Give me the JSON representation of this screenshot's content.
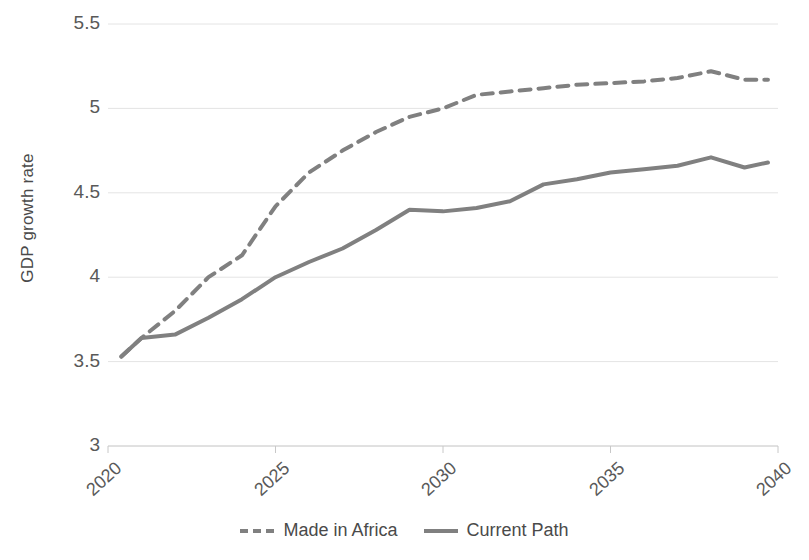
{
  "chart_data": {
    "type": "line",
    "title": "",
    "xlabel": "",
    "ylabel": "GDP growth rate",
    "xlim": [
      2020,
      2040
    ],
    "ylim": [
      3,
      5.5
    ],
    "grid": true,
    "legend_position": "bottom",
    "x_ticks": [
      "2020",
      "2025",
      "2030",
      "2035",
      "2040"
    ],
    "y_ticks": [
      "3",
      "3.5",
      "4",
      "4.5",
      "5",
      "5.5"
    ],
    "x": [
      2020.4,
      2021,
      2022,
      2023,
      2024,
      2025,
      2026,
      2027,
      2028,
      2029,
      2030,
      2031,
      2032,
      2033,
      2034,
      2035,
      2036,
      2037,
      2038,
      2039,
      2039.7
    ],
    "series": [
      {
        "name": "Made in Africa",
        "style": "dashed",
        "color": "#808080",
        "values": [
          3.53,
          3.64,
          3.8,
          4.0,
          4.13,
          4.42,
          4.62,
          4.75,
          4.86,
          4.95,
          5.0,
          5.08,
          5.1,
          5.12,
          5.14,
          5.15,
          5.16,
          5.18,
          5.22,
          5.17,
          5.17
        ]
      },
      {
        "name": "Current Path",
        "style": "solid",
        "color": "#808080",
        "values": [
          3.53,
          3.64,
          3.66,
          3.76,
          3.87,
          4.0,
          4.09,
          4.17,
          4.28,
          4.4,
          4.39,
          4.41,
          4.45,
          4.55,
          4.58,
          4.62,
          4.64,
          4.66,
          4.71,
          4.65,
          4.68
        ]
      }
    ]
  },
  "legend": {
    "items": [
      {
        "label": "Made in Africa"
      },
      {
        "label": "Current Path"
      }
    ]
  },
  "axes": {
    "y_title": "GDP growth rate"
  }
}
